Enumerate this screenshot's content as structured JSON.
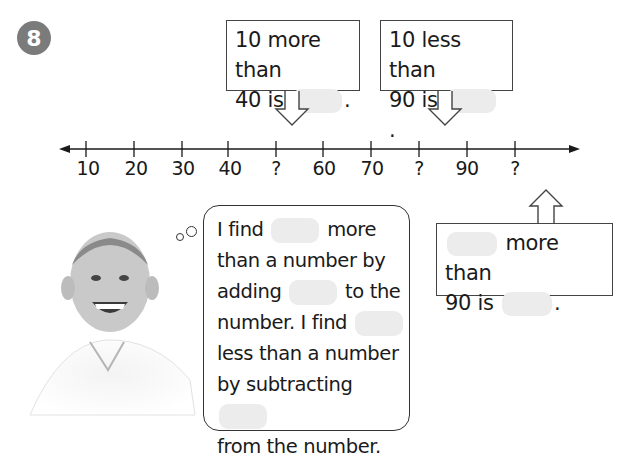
{
  "problem": {
    "number": "8"
  },
  "callouts": {
    "more_than_40": {
      "line1": "10 more than",
      "line2_prefix": "40 is",
      "line2_suffix": "."
    },
    "less_than_90": {
      "line1": "10 less than",
      "line2_prefix": "90 is",
      "line2_suffix": "."
    },
    "more_than_90": {
      "line1_suffix": "more than",
      "line2_prefix": "90 is",
      "line2_suffix": "."
    }
  },
  "number_line": {
    "labels": [
      "10",
      "20",
      "30",
      "40",
      "?",
      "60",
      "70",
      "?",
      "90",
      "?"
    ]
  },
  "thought_bubble": {
    "l1a": "I find",
    "l1b": "more",
    "l2": "than a number by",
    "l3a": "adding",
    "l3b": "to the",
    "l4": "number. I find",
    "l5": "less than a number",
    "l6": "by subtracting",
    "l7": "from the number."
  },
  "image": {
    "description": "smiling boy in white polo shirt"
  },
  "colors": {
    "badge": "#7b7b7b",
    "blank": "#ececec",
    "line": "#1a1a1a"
  }
}
